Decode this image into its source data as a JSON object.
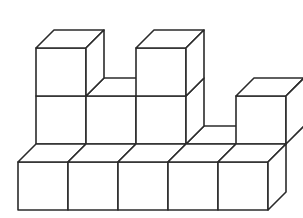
{
  "figure": {
    "type": "isometric-block-figure",
    "canvas": {
      "width": 303,
      "height": 218,
      "background": "#ffffff"
    },
    "style": {
      "stroke_color": "#2b2b2b",
      "stroke_width": 1.6,
      "face_fill": "#ffffff"
    },
    "projection": {
      "note": "Screen position = origin + col*ux + row*uz + layer*uy",
      "origin": [
        18,
        210
      ],
      "unit_x": [
        50,
        0
      ],
      "unit_y": [
        0,
        -48
      ],
      "unit_z": [
        18,
        -18
      ]
    },
    "counts": {
      "total_cubes": 13,
      "columns": 5,
      "rows": 2,
      "levels": 3
    },
    "cubes": [
      {
        "name": "front-row-col0",
        "col": 0,
        "row": 0,
        "level": 0
      },
      {
        "name": "front-row-col1",
        "col": 1,
        "row": 0,
        "level": 0
      },
      {
        "name": "front-row-col2",
        "col": 2,
        "row": 0,
        "level": 0
      },
      {
        "name": "front-row-col3",
        "col": 3,
        "row": 0,
        "level": 0
      },
      {
        "name": "front-row-col4",
        "col": 4,
        "row": 0,
        "level": 0
      },
      {
        "name": "back-row-col0",
        "col": 0,
        "row": 1,
        "level": 0
      },
      {
        "name": "back-row-col1",
        "col": 1,
        "row": 1,
        "level": 0
      },
      {
        "name": "back-row-col2",
        "col": 2,
        "row": 1,
        "level": 0
      },
      {
        "name": "back-row-col3",
        "col": 3,
        "row": 1,
        "level": 0
      },
      {
        "name": "back-row-col0-level1",
        "col": 0,
        "row": 1,
        "level": 1
      },
      {
        "name": "back-row-col1-level1",
        "col": 1,
        "row": 1,
        "level": 1
      },
      {
        "name": "back-row-col2-level1",
        "col": 2,
        "row": 1,
        "level": 1
      },
      {
        "name": "back-row-col4-level1",
        "col": 4,
        "row": 1,
        "level": 1
      },
      {
        "name": "back-row-col0-level2",
        "col": 0,
        "row": 1,
        "level": 2
      },
      {
        "name": "back-row-col2-level2",
        "col": 2,
        "row": 1,
        "level": 2
      }
    ]
  }
}
